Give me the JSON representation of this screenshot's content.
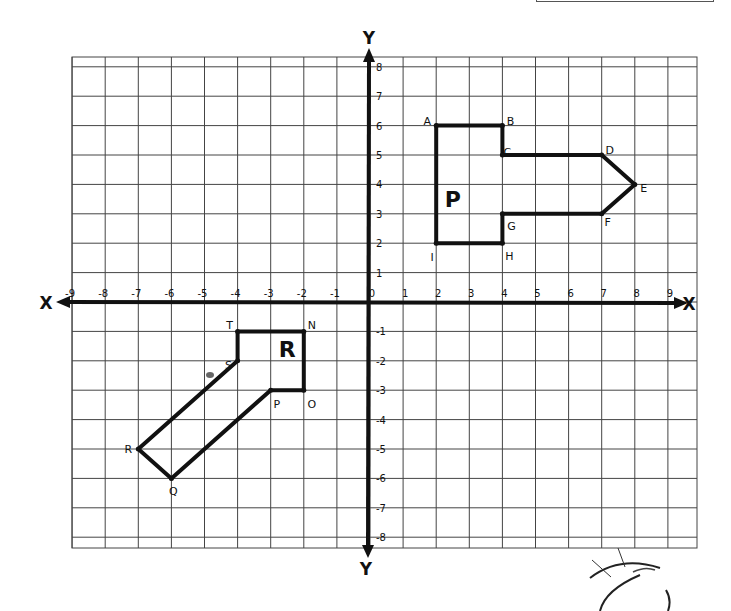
{
  "chart_data": {
    "type": "coordinate-grid",
    "title": "",
    "xlabel": "X",
    "ylabel": "Y",
    "x_range": [
      -9,
      9
    ],
    "y_range": [
      -8,
      8
    ],
    "grid": true,
    "x_ticks": [
      "-9",
      "-8",
      "-7",
      "-6",
      "-5",
      "-4",
      "-3",
      "-2",
      "-1",
      "0",
      "1",
      "2",
      "3",
      "4",
      "5",
      "6",
      "7",
      "8",
      "9"
    ],
    "y_ticks": [
      "8",
      "7",
      "6",
      "5",
      "4",
      "3",
      "2",
      "1",
      "-1",
      "-2",
      "-3",
      "-4",
      "-5",
      "-6",
      "-7",
      "-8"
    ],
    "shapes": [
      {
        "label": "P",
        "label_pos": [
          2.5,
          3.5
        ],
        "vertices": [
          {
            "name": "A",
            "x": 2,
            "y": 6
          },
          {
            "name": "B",
            "x": 4,
            "y": 6
          },
          {
            "name": "C",
            "x": 4,
            "y": 5
          },
          {
            "name": "D",
            "x": 7,
            "y": 5
          },
          {
            "name": "E",
            "x": 8,
            "y": 4
          },
          {
            "name": "F",
            "x": 7,
            "y": 3
          },
          {
            "name": "G",
            "x": 4,
            "y": 3
          },
          {
            "name": "H",
            "x": 4,
            "y": 2
          },
          {
            "name": "I",
            "x": 2,
            "y": 2
          }
        ]
      },
      {
        "label": "R",
        "label_pos": [
          -2.5,
          -1.6
        ],
        "vertices": [
          {
            "name": "T",
            "x": -4,
            "y": -1
          },
          {
            "name": "N",
            "x": -2,
            "y": -1
          },
          {
            "name": "O",
            "x": -2,
            "y": -3
          },
          {
            "name": "P",
            "x": -3,
            "y": -3
          },
          {
            "name": "Q",
            "x": -6,
            "y": -6
          },
          {
            "name": "R",
            "x": -7,
            "y": -5
          },
          {
            "name": "S",
            "x": -4,
            "y": -2
          }
        ]
      }
    ]
  },
  "axes": {
    "x_label_left": "X",
    "x_label_right": "X",
    "y_label_top": "Y",
    "y_label_bottom": "Y"
  }
}
